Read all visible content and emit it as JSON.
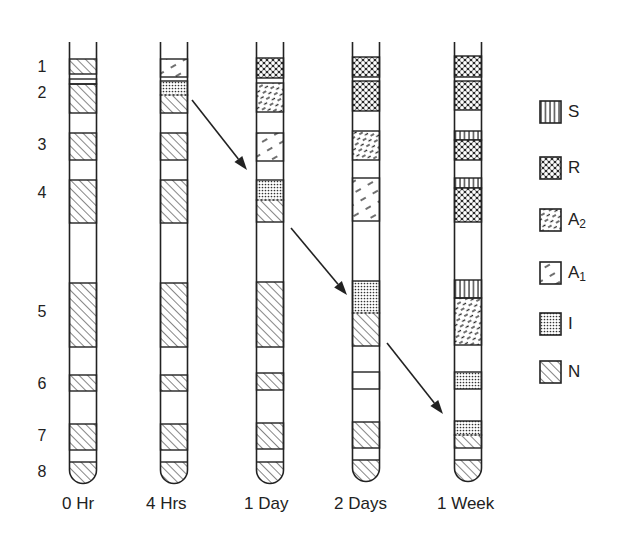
{
  "figure": {
    "band_numbers": [
      "1",
      "2",
      "3",
      "4",
      "5",
      "6",
      "7",
      "8"
    ],
    "tubes": [
      {
        "label": "0 Hr",
        "x": 83,
        "bands": [
          {
            "y1": 59,
            "y2": 74,
            "fill": "N"
          },
          {
            "y1": 79,
            "y2": 84,
            "fill": "none"
          },
          {
            "y1": 84,
            "y2": 113,
            "fill": "N"
          },
          {
            "y1": 133,
            "y2": 160,
            "fill": "N"
          },
          {
            "y1": 180,
            "y2": 223,
            "fill": "N"
          },
          {
            "y1": 283,
            "y2": 347,
            "fill": "N"
          },
          {
            "y1": 375,
            "y2": 391,
            "fill": "N"
          },
          {
            "y1": 424,
            "y2": 450,
            "fill": "N"
          },
          {
            "y1": 462,
            "y2": 485,
            "fill": "N",
            "cap": true
          }
        ]
      },
      {
        "label": "4 Hrs",
        "x": 174,
        "bands": [
          {
            "y1": 59,
            "y2": 77,
            "fill": "A1"
          },
          {
            "y1": 81,
            "y2": 95,
            "fill": "I"
          },
          {
            "y1": 95,
            "y2": 113,
            "fill": "N",
            "dotted_top": true
          },
          {
            "y1": 133,
            "y2": 160,
            "fill": "N"
          },
          {
            "y1": 180,
            "y2": 223,
            "fill": "N"
          },
          {
            "y1": 283,
            "y2": 347,
            "fill": "N"
          },
          {
            "y1": 375,
            "y2": 391,
            "fill": "N"
          },
          {
            "y1": 424,
            "y2": 450,
            "fill": "N"
          },
          {
            "y1": 462,
            "y2": 485,
            "fill": "N",
            "cap": true
          }
        ]
      },
      {
        "label": "1 Day",
        "x": 270,
        "bands": [
          {
            "y1": 58,
            "y2": 78,
            "fill": "R"
          },
          {
            "y1": 83,
            "y2": 112,
            "fill": "A2"
          },
          {
            "y1": 133,
            "y2": 161,
            "fill": "A1"
          },
          {
            "y1": 180,
            "y2": 200,
            "fill": "I"
          },
          {
            "y1": 200,
            "y2": 222,
            "fill": "N",
            "dotted_top": true
          },
          {
            "y1": 282,
            "y2": 347,
            "fill": "N"
          },
          {
            "y1": 373,
            "y2": 390,
            "fill": "N"
          },
          {
            "y1": 423,
            "y2": 449,
            "fill": "N"
          },
          {
            "y1": 462,
            "y2": 485,
            "fill": "N",
            "cap": true
          }
        ]
      },
      {
        "label": "2 Days",
        "x": 366,
        "bands": [
          {
            "y1": 57,
            "y2": 77,
            "fill": "R"
          },
          {
            "y1": 81,
            "y2": 111,
            "fill": "R"
          },
          {
            "y1": 131,
            "y2": 160,
            "fill": "A2"
          },
          {
            "y1": 178,
            "y2": 221,
            "fill": "A1"
          },
          {
            "y1": 281,
            "y2": 313,
            "fill": "I"
          },
          {
            "y1": 313,
            "y2": 346,
            "fill": "N",
            "dotted_top": true
          },
          {
            "y1": 372,
            "y2": 389,
            "fill": "none"
          },
          {
            "y1": 422,
            "y2": 448,
            "fill": "N"
          },
          {
            "y1": 460,
            "y2": 484,
            "fill": "N",
            "cap": true
          }
        ]
      },
      {
        "label": "1 Week",
        "x": 468,
        "bands": [
          {
            "y1": 56,
            "y2": 77,
            "fill": "R"
          },
          {
            "y1": 81,
            "y2": 110,
            "fill": "R"
          },
          {
            "y1": 131,
            "y2": 140,
            "fill": "S"
          },
          {
            "y1": 140,
            "y2": 160,
            "fill": "R"
          },
          {
            "y1": 178,
            "y2": 188,
            "fill": "S"
          },
          {
            "y1": 188,
            "y2": 222,
            "fill": "R"
          },
          {
            "y1": 280,
            "y2": 298,
            "fill": "S"
          },
          {
            "y1": 298,
            "y2": 345,
            "fill": "A2"
          },
          {
            "y1": 372,
            "y2": 389,
            "fill": "I"
          },
          {
            "y1": 421,
            "y2": 435,
            "fill": "I"
          },
          {
            "y1": 435,
            "y2": 448,
            "fill": "N",
            "dotted_top": true
          },
          {
            "y1": 460,
            "y2": 484,
            "fill": "N",
            "cap": true
          }
        ]
      }
    ],
    "arrows": [
      {
        "x1": 192,
        "y1": 100,
        "x2": 247,
        "y2": 170
      },
      {
        "x1": 291,
        "y1": 228,
        "x2": 347,
        "y2": 295
      },
      {
        "x1": 387,
        "y1": 343,
        "x2": 443,
        "y2": 414
      }
    ],
    "legend": [
      {
        "key": "S",
        "label": "S",
        "sub": ""
      },
      {
        "key": "R",
        "label": "R",
        "sub": ""
      },
      {
        "key": "A2",
        "label": "A",
        "sub": "2"
      },
      {
        "key": "A1",
        "label": "A",
        "sub": "1"
      },
      {
        "key": "I",
        "label": "I",
        "sub": ""
      },
      {
        "key": "N",
        "label": "N",
        "sub": ""
      }
    ]
  }
}
